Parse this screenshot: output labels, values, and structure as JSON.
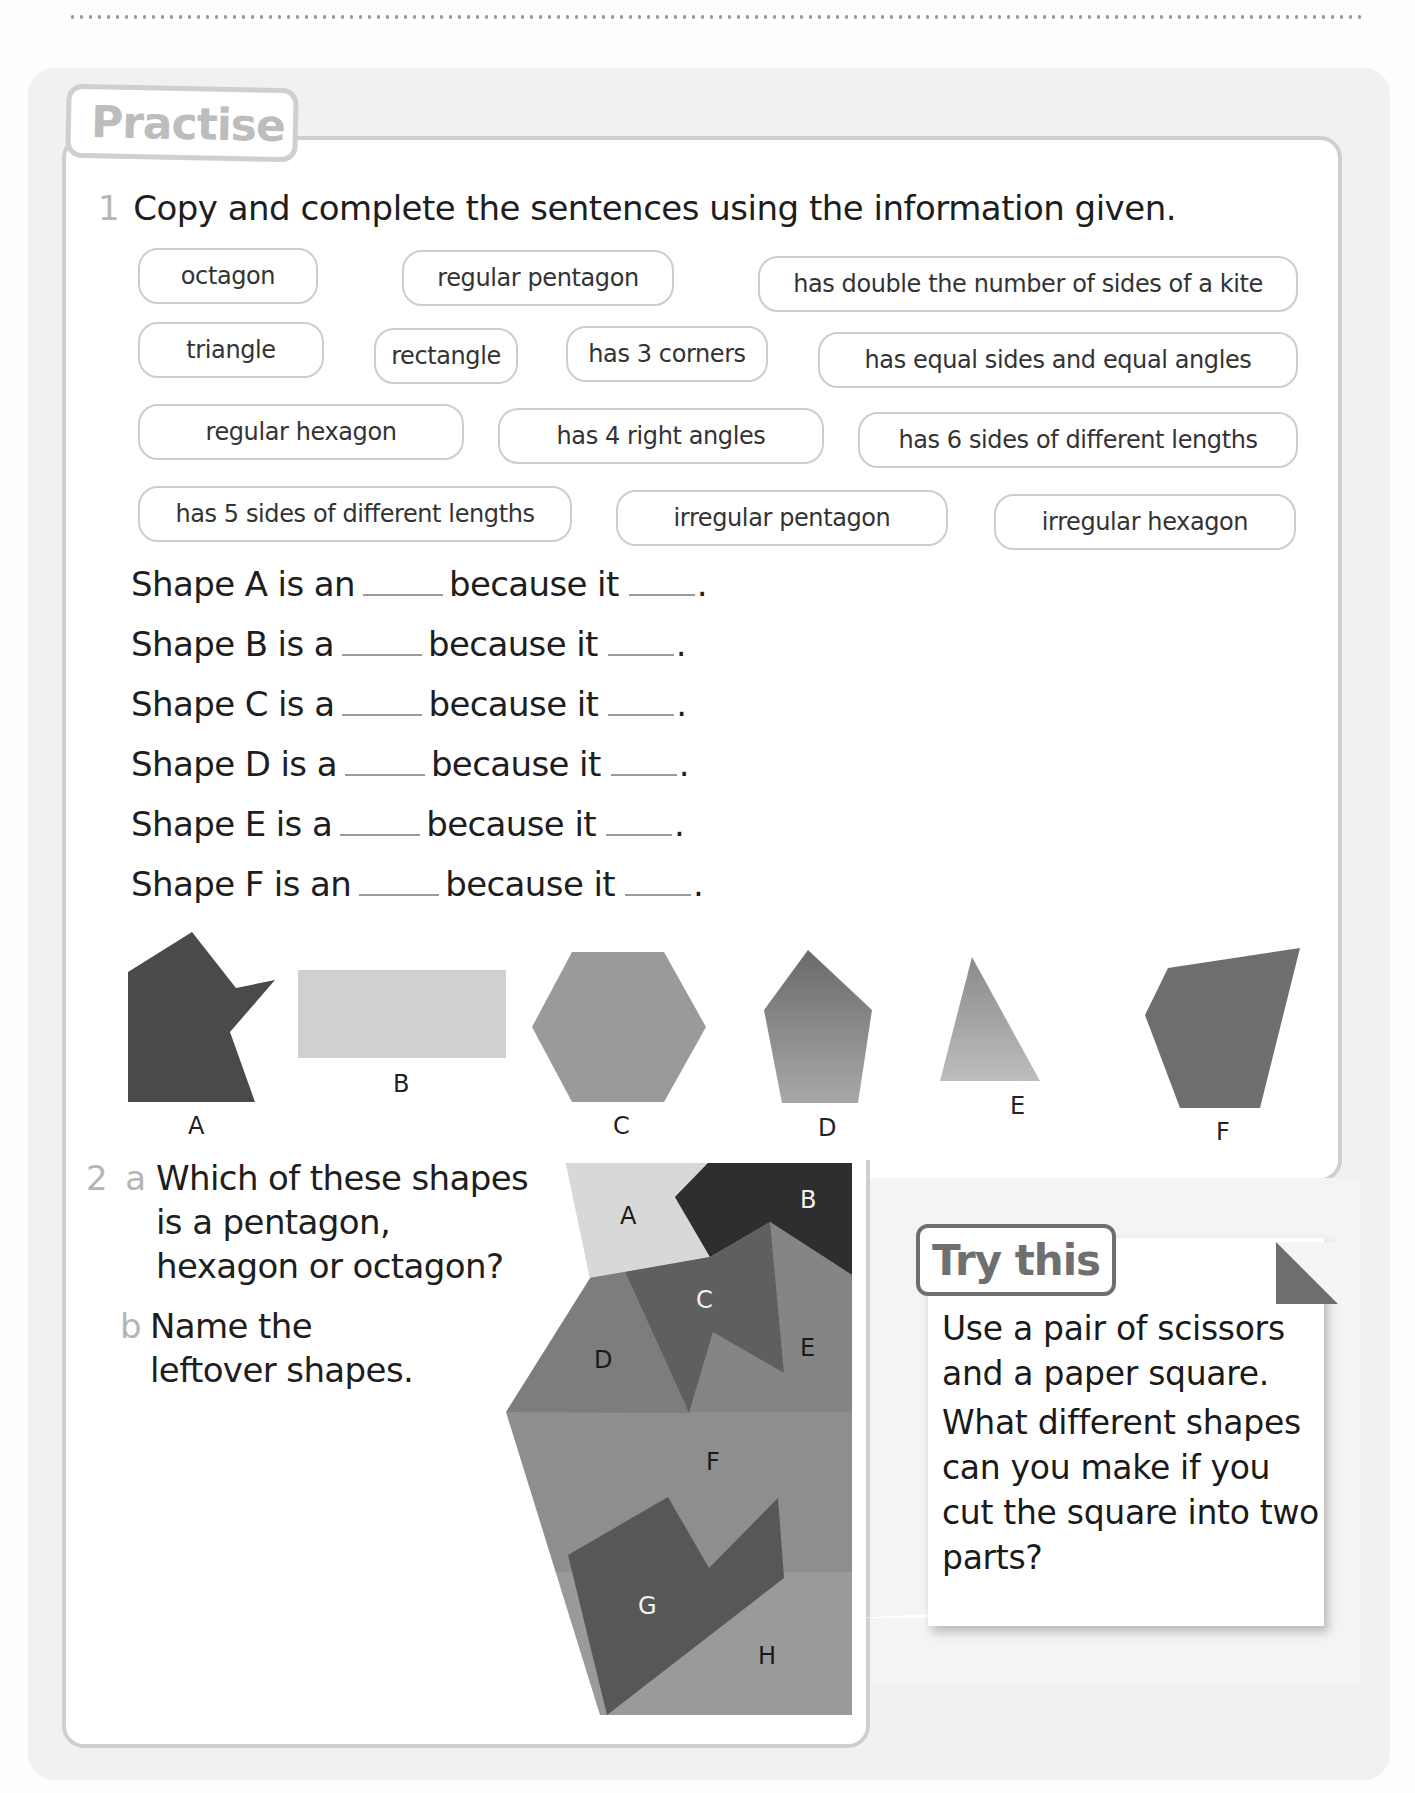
{
  "header": {
    "dotted_rule": true
  },
  "practise": {
    "title": "Practise",
    "q1": {
      "number": "1",
      "prompt": "Copy and complete the sentences using the information given.",
      "chips": [
        {
          "label": "octagon"
        },
        {
          "label": "regular pentagon"
        },
        {
          "label": "has double the number of sides of a kite"
        },
        {
          "label": "triangle"
        },
        {
          "label": "rectangle"
        },
        {
          "label": "has 3 corners"
        },
        {
          "label": "has equal sides and equal angles"
        },
        {
          "label": "regular hexagon"
        },
        {
          "label": "has 4 right angles"
        },
        {
          "label": "has 6 sides of different lengths"
        },
        {
          "label": "has 5 sides of different lengths"
        },
        {
          "label": "irregular pentagon"
        },
        {
          "label": "irregular hexagon"
        }
      ],
      "sentences": [
        {
          "start": "Shape A is an",
          "middle": "because it",
          "end": "."
        },
        {
          "start": "Shape B is a",
          "middle": "because it",
          "end": "."
        },
        {
          "start": "Shape C is a",
          "middle": "because it",
          "end": "."
        },
        {
          "start": "Shape D is a",
          "middle": "because it",
          "end": "."
        },
        {
          "start": "Shape E is a",
          "middle": "because it",
          "end": "."
        },
        {
          "start": "Shape F is an",
          "middle": "because it",
          "end": "."
        }
      ],
      "shapes": [
        {
          "label": "A",
          "kind": "irregular hexagon",
          "color": "#4a4a4a"
        },
        {
          "label": "B",
          "kind": "rectangle",
          "color": "#d0d0d0"
        },
        {
          "label": "C",
          "kind": "regular hexagon",
          "color": "#9a9a9a"
        },
        {
          "label": "D",
          "kind": "regular pentagon",
          "color": "#7a7a7a"
        },
        {
          "label": "E",
          "kind": "triangle",
          "color": "#a5a5a5"
        },
        {
          "label": "F",
          "kind": "irregular pentagon",
          "color": "#6e6e6e"
        }
      ]
    },
    "q2": {
      "number": "2",
      "a_label": "a",
      "a_lines": [
        "Which of these shapes",
        "is a pentagon,",
        "hexagon or octagon?"
      ],
      "b_label": "b",
      "b_lines": [
        "Name the",
        "leftover shapes."
      ],
      "puzzle_labels": [
        "A",
        "B",
        "C",
        "D",
        "E",
        "F",
        "G",
        "H"
      ]
    }
  },
  "try_this": {
    "title": "Try this",
    "paragraphs": [
      "Use a pair of scissors and a paper square.",
      "What different shapes can you make if you cut the square into two parts?"
    ]
  }
}
